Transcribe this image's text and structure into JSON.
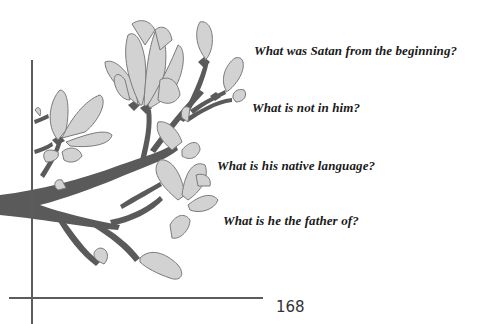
{
  "questions": [
    {
      "text": "What was Satan from the beginning?"
    },
    {
      "text": "What is not in him?"
    },
    {
      "text": "What is his native language?"
    },
    {
      "text": "What is he the father of?"
    }
  ],
  "page_number": "168",
  "illustration": {
    "subject": "magnolia-branch",
    "colors": {
      "petal": "#d2d2d2",
      "petal_outline": "#7a7a7a",
      "branch": "#5a5a5a",
      "rule": "#5c5c5c"
    }
  }
}
